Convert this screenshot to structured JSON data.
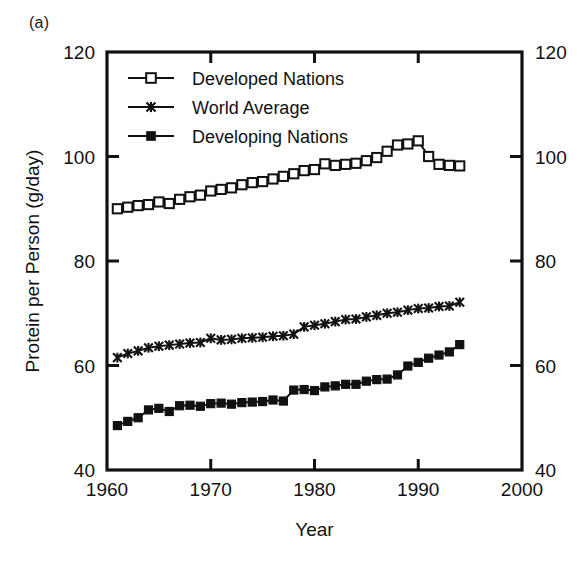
{
  "figure": {
    "panel_label": "(a)"
  },
  "chart_data": {
    "type": "line",
    "title": "",
    "xlabel": "Year",
    "ylabel": "Protein per Person (g/day)",
    "xlim": [
      1960,
      2000
    ],
    "ylim": [
      40,
      120
    ],
    "xticks": [
      1960,
      1970,
      1980,
      1990,
      2000
    ],
    "xtick_labels": [
      "1960",
      "1970",
      "1980",
      "1990",
      "2000"
    ],
    "yticks": [
      40,
      60,
      80,
      100,
      120
    ],
    "ytick_labels": [
      "40",
      "60",
      "80",
      "100",
      "120"
    ],
    "right_axis_ticks": [
      40,
      60,
      80,
      100,
      120
    ],
    "right_axis_tick_labels": [
      "40",
      "60",
      "80",
      "100",
      "120"
    ],
    "grid": false,
    "legend_position": "upper-left-inside",
    "x": [
      1961,
      1962,
      1963,
      1964,
      1965,
      1966,
      1967,
      1968,
      1969,
      1970,
      1971,
      1972,
      1973,
      1974,
      1975,
      1976,
      1977,
      1978,
      1979,
      1980,
      1981,
      1982,
      1983,
      1984,
      1985,
      1986,
      1987,
      1988,
      1989,
      1990,
      1991,
      1992,
      1993,
      1994
    ],
    "series": [
      {
        "name": "Developed Nations",
        "marker": "open-square",
        "values": [
          90.0,
          90.3,
          90.6,
          90.8,
          91.3,
          91.0,
          91.8,
          92.3,
          92.6,
          93.4,
          93.7,
          94.0,
          94.6,
          95.0,
          95.2,
          95.7,
          96.2,
          96.7,
          97.3,
          97.5,
          98.6,
          98.3,
          98.5,
          98.7,
          99.2,
          99.8,
          101.0,
          102.2,
          102.4,
          103.0,
          100.0,
          98.5,
          98.3,
          98.2
        ]
      },
      {
        "name": "World Average",
        "marker": "cross",
        "values": [
          61.5,
          62.3,
          62.8,
          63.4,
          63.7,
          63.9,
          64.1,
          64.3,
          64.4,
          65.2,
          64.9,
          65.0,
          65.2,
          65.3,
          65.4,
          65.6,
          65.7,
          66.0,
          67.4,
          67.7,
          68.0,
          68.4,
          68.8,
          68.9,
          69.3,
          69.6,
          70.0,
          70.2,
          70.6,
          70.9,
          71.0,
          71.3,
          71.4,
          72.1
        ]
      },
      {
        "name": "Developing Nations",
        "marker": "filled-square",
        "values": [
          48.5,
          49.3,
          50.0,
          51.5,
          51.8,
          51.2,
          52.3,
          52.4,
          52.2,
          52.7,
          52.8,
          52.6,
          52.9,
          53.0,
          53.1,
          53.4,
          53.2,
          55.3,
          55.4,
          55.2,
          55.9,
          56.1,
          56.4,
          56.4,
          57.0,
          57.3,
          57.4,
          58.2,
          59.9,
          60.6,
          61.4,
          62.0,
          62.6,
          64.0
        ]
      }
    ]
  },
  "legend": {
    "items": [
      {
        "label": "Developed Nations",
        "marker": "open-square"
      },
      {
        "label": "World Average",
        "marker": "cross"
      },
      {
        "label": "Developing Nations",
        "marker": "filled-square"
      }
    ]
  }
}
